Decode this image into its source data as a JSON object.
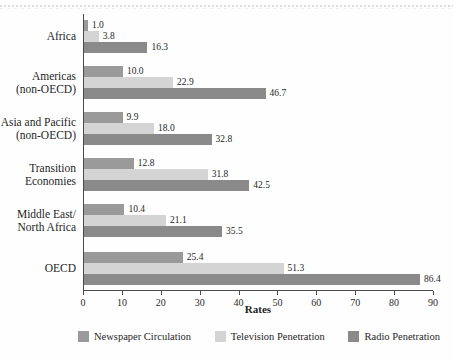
{
  "chart_data": {
    "type": "bar",
    "orientation": "horizontal",
    "title": "",
    "xlabel": "Rates",
    "ylabel": "",
    "xlim": [
      0,
      90
    ],
    "xticks": [
      0,
      10,
      20,
      30,
      40,
      50,
      60,
      70,
      80,
      90
    ],
    "grid": false,
    "legend_position": "bottom",
    "categories": [
      "Africa",
      "Americas (non-OECD)",
      "Asia and Pacific (non-OECD)",
      "Transition Economies",
      "Middle East/North Africa",
      "OECD"
    ],
    "series": [
      {
        "name": "Newspaper Circulation",
        "color": "#9a9a9a",
        "values": [
          1.0,
          10.0,
          9.9,
          12.8,
          10.4,
          25.4
        ],
        "labels": [
          "1.0",
          "10.0",
          "9.9",
          "12.8",
          "10.4",
          "25.4"
        ]
      },
      {
        "name": "Television Penetration",
        "color": "#d4d4d4",
        "values": [
          3.8,
          22.9,
          18.0,
          31.8,
          21.1,
          51.3
        ],
        "labels": [
          "3.8",
          "22.9",
          "18.0",
          "31.8",
          "21.1",
          "51.3"
        ]
      },
      {
        "name": "Radio Penetration",
        "color": "#8a8a8a",
        "values": [
          16.3,
          46.7,
          32.8,
          42.5,
          35.5,
          86.4
        ],
        "labels": [
          "16.3",
          "46.7",
          "32.8",
          "42.5",
          "35.5",
          "86.4"
        ]
      }
    ]
  },
  "axis": {
    "x_tick_labels": [
      "0",
      "10",
      "20",
      "30",
      "40",
      "50",
      "60",
      "70",
      "80",
      "90"
    ],
    "x_title": "Rates"
  },
  "category_labels": [
    {
      "lines": [
        "Africa"
      ]
    },
    {
      "lines": [
        "Americas",
        "(non-OECD)"
      ]
    },
    {
      "lines": [
        "Asia and Pacific",
        "(non-OECD)"
      ]
    },
    {
      "lines": [
        "Transition",
        "Economies"
      ]
    },
    {
      "lines": [
        "Middle East/",
        "North Africa"
      ]
    },
    {
      "lines": [
        "OECD"
      ]
    }
  ],
  "legend": {
    "items": [
      {
        "label": "Newspaper Circulation",
        "color": "#9a9a9a"
      },
      {
        "label": "Television Penetration",
        "color": "#d4d4d4"
      },
      {
        "label": "Radio Penetration",
        "color": "#8a8a8a"
      }
    ]
  }
}
